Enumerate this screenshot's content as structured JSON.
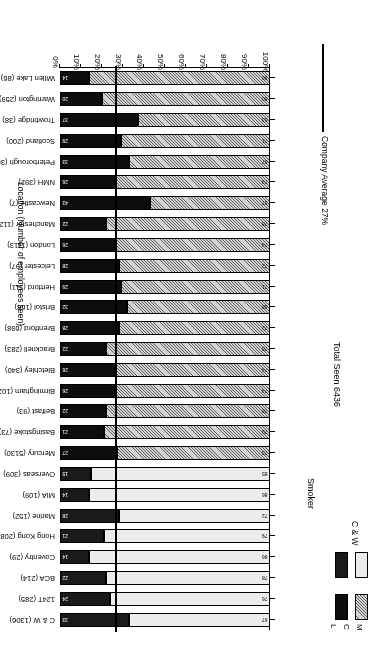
{
  "chart_data": {
    "type": "bar",
    "orientation": "horizontal-stacked",
    "title": "",
    "xlabel": "",
    "ylabel": "Location (Number of employees seen)",
    "xlim": [
      0,
      100
    ],
    "x_tick_labels": [
      "0%",
      "10%",
      "20%",
      "30%",
      "40%",
      "50%",
      "60%",
      "70%",
      "80%",
      "90%",
      "100%"
    ],
    "x_ticks": [
      0,
      10,
      20,
      30,
      40,
      50,
      60,
      70,
      80,
      90,
      100
    ],
    "grid": false,
    "annotations": {
      "total_seen": "Total Seen 6436",
      "company_average": "Company Average 27%",
      "company_average_value": 27
    },
    "legend": {
      "title": "Smoker",
      "position": "top-left",
      "keys": [
        "M",
        "C",
        "L"
      ],
      "groups": [
        {
          "name": "C & W",
          "non_smoker_swatch": "light-dotted",
          "smoker_swatch": "dark-speckled"
        },
        {
          "name": "MCL",
          "non_smoker_swatch": "grey-hatched",
          "smoker_swatch": "solid-black"
        }
      ]
    },
    "series": [
      {
        "name": "Non-smoker",
        "key": "non_smoker"
      },
      {
        "name": "Smoker",
        "key": "smoker"
      }
    ],
    "categories": [
      "C & W (1306)",
      "124T (285)",
      "BCA (214)",
      "Coventry (29)",
      "Hong Kong (208)",
      "Marine (152)",
      "MIA (109)",
      "Overseas (309)",
      "Mercury (5130)",
      "Basingstoke (73)",
      "Belfast (93)",
      "Birmingham (1024)",
      "Bletchley (340)",
      "Bracknell (283)",
      "Brentford (698)",
      "Bristol (168)",
      "Hertford (111)",
      "Leicester (97)",
      "London (1113)",
      "Manchester (112)",
      "Newcastle (7)",
      "NMH (392)",
      "Peterborough (36)",
      "Scotland (200)",
      "Trowbridge (38)",
      "Warrington (259)",
      "Willen Lake (86)"
    ],
    "bars": [
      {
        "location": "C & W (1306)",
        "group": "C & W",
        "non_smoker": 67,
        "smoker": 33
      },
      {
        "location": "124T (285)",
        "group": "C & W",
        "non_smoker": 76,
        "smoker": 24
      },
      {
        "location": "BCA (214)",
        "group": "C & W",
        "non_smoker": 78,
        "smoker": 22
      },
      {
        "location": "Coventry (29)",
        "group": "C & W",
        "non_smoker": 86,
        "smoker": 14
      },
      {
        "location": "Hong Kong (208)",
        "group": "C & W",
        "non_smoker": 79,
        "smoker": 21
      },
      {
        "location": "Marine (152)",
        "group": "C & W",
        "non_smoker": 72,
        "smoker": 28
      },
      {
        "location": "MIA (109)",
        "group": "C & W",
        "non_smoker": 86,
        "smoker": 14
      },
      {
        "location": "Overseas (309)",
        "group": "C & W",
        "non_smoker": 85,
        "smoker": 15
      },
      {
        "location": "Mercury (5130)",
        "group": "MCL",
        "non_smoker": 73,
        "smoker": 27
      },
      {
        "location": "Basingstoke (73)",
        "group": "MCL",
        "non_smoker": 79,
        "smoker": 21
      },
      {
        "location": "Belfast (93)",
        "group": "MCL",
        "non_smoker": 78,
        "smoker": 22
      },
      {
        "location": "Birmingham (1024)",
        "group": "MCL",
        "non_smoker": 74,
        "smoker": 26
      },
      {
        "location": "Bletchley (340)",
        "group": "MCL",
        "non_smoker": 74,
        "smoker": 26
      },
      {
        "location": "Bracknell (283)",
        "group": "MCL",
        "non_smoker": 78,
        "smoker": 22
      },
      {
        "location": "Brentford (698)",
        "group": "MCL",
        "non_smoker": 72,
        "smoker": 28
      },
      {
        "location": "Bristol (168)",
        "group": "MCL",
        "non_smoker": 68,
        "smoker": 32
      },
      {
        "location": "Hertford (111)",
        "group": "MCL",
        "non_smoker": 71,
        "smoker": 29
      },
      {
        "location": "Leicester (97)",
        "group": "MCL",
        "non_smoker": 72,
        "smoker": 28
      },
      {
        "location": "London (1113)",
        "group": "MCL",
        "non_smoker": 74,
        "smoker": 26
      },
      {
        "location": "Manchester (112)",
        "group": "MCL",
        "non_smoker": 78,
        "smoker": 22
      },
      {
        "location": "Newcastle (7)",
        "group": "MCL",
        "non_smoker": 57,
        "smoker": 43
      },
      {
        "location": "NMH (392)",
        "group": "MCL",
        "non_smoker": 74,
        "smoker": 26
      },
      {
        "location": "Peterborough (36)",
        "group": "MCL",
        "non_smoker": 67,
        "smoker": 33
      },
      {
        "location": "Scotland (200)",
        "group": "MCL",
        "non_smoker": 71,
        "smoker": 29
      },
      {
        "location": "Trowbridge (38)",
        "group": "MCL",
        "non_smoker": 63,
        "smoker": 37
      },
      {
        "location": "Warrington (259)",
        "group": "MCL",
        "non_smoker": 80,
        "smoker": 20
      },
      {
        "location": "Willen Lake (86)",
        "group": "MCL",
        "non_smoker": 86,
        "smoker": 14
      }
    ]
  }
}
